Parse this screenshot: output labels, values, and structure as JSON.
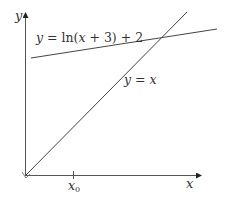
{
  "diagram": {
    "axes": {
      "x_label": "x",
      "y_label": "y",
      "x_tick_label": "x",
      "x_tick_subscript": "0"
    },
    "curves": [
      {
        "name": "log-curve",
        "label": "y = ln(x + 3) + 2",
        "label_parts": {
          "y": "y",
          "eq": " = ln(",
          "x": "x",
          "rest": " + 3) + 2"
        }
      },
      {
        "name": "identity-line",
        "label": "y = x",
        "label_parts": {
          "y": "y",
          "eq": " = ",
          "x": "x"
        }
      }
    ],
    "colors": {
      "line": "#444444",
      "text": "#333333",
      "background": "#ffffff"
    }
  }
}
